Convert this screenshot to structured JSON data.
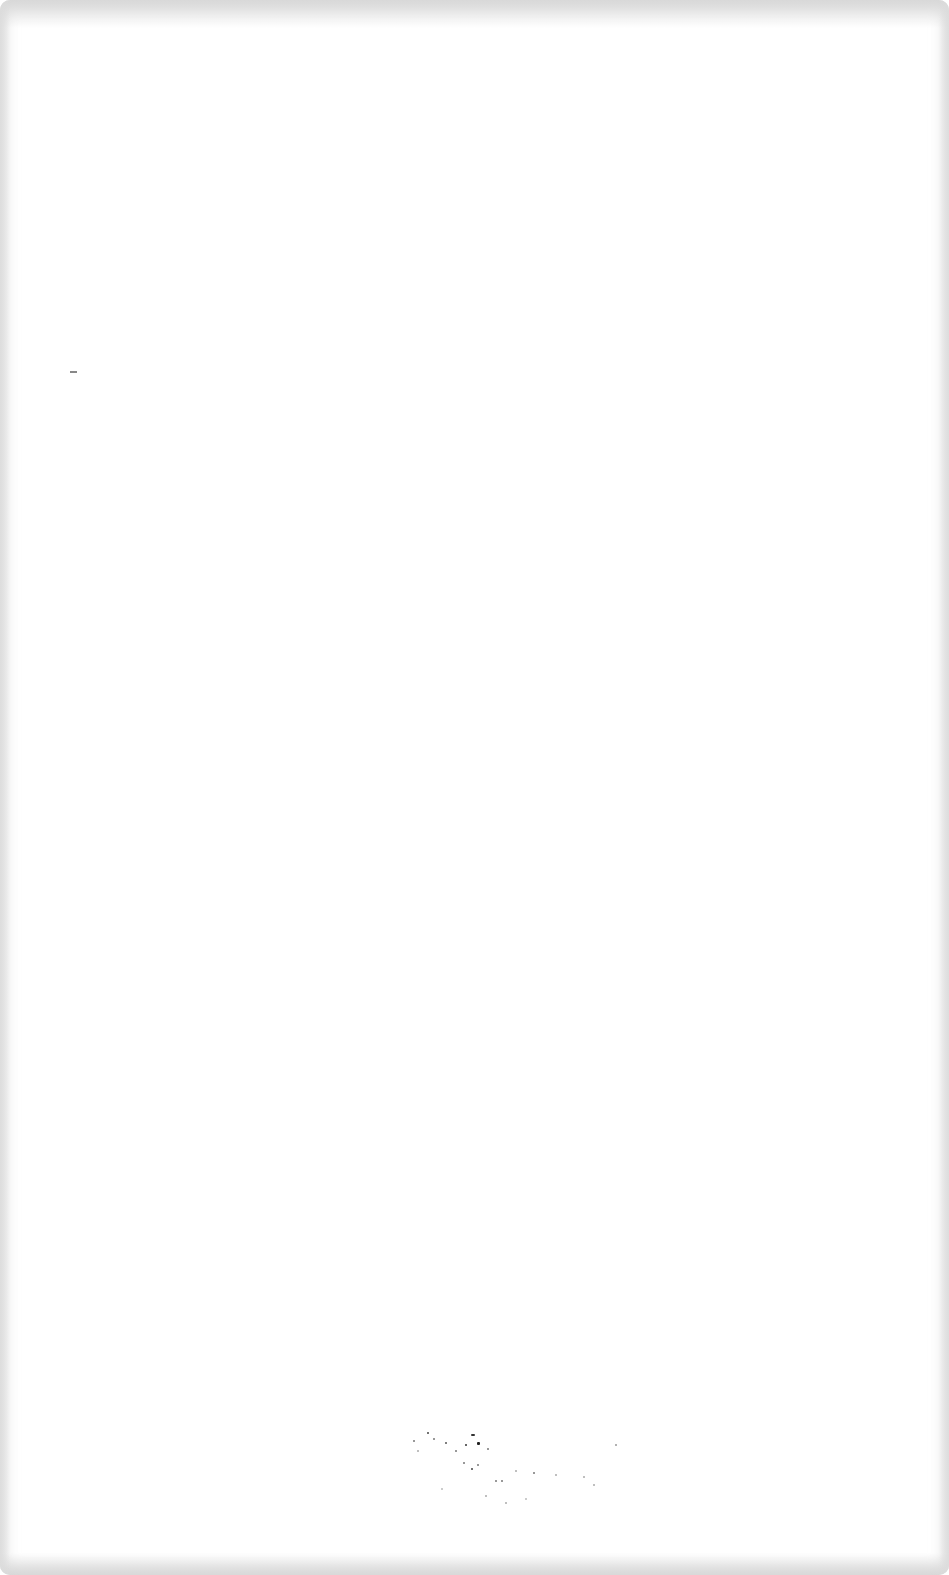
{
  "page": {
    "background": "#ffffff",
    "content": []
  }
}
